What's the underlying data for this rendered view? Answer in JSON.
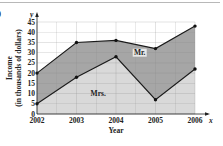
{
  "panel_label": ")",
  "chart_data": {
    "type": "area",
    "title": "",
    "xlabel": "Year",
    "ylabel": "Income\n(in thousands of dollars)",
    "ylabel_lines": [
      "Income",
      "(in thousands of dollars)"
    ],
    "x_axis_letter": "x",
    "y_axis_letter": "y",
    "categories": [
      "2002",
      "2003",
      "2004",
      "2005",
      "2006"
    ],
    "yticks": [
      0,
      5,
      10,
      15,
      20,
      25,
      30,
      35,
      40,
      45
    ],
    "ylim": [
      0,
      45
    ],
    "grid": true,
    "series": [
      {
        "name": "Mrs.",
        "values": [
          5,
          18,
          28,
          7,
          22
        ],
        "fill": "#d9d9d9"
      },
      {
        "name": "Mr.",
        "values": [
          20,
          35,
          36,
          32,
          43
        ],
        "fill": "#a6a6a6",
        "note": "stacked total (Mr. + Mrs.)"
      }
    ],
    "annotations": [
      {
        "text": "Mr.",
        "x": "2004.6",
        "y": 29
      },
      {
        "text": "Mrs.",
        "x": "2003.5",
        "y": 9
      }
    ]
  }
}
